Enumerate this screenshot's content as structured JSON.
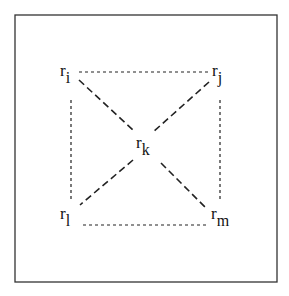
{
  "diagram": {
    "nodes": [
      {
        "id": "i",
        "base": "r",
        "sub": "i",
        "x": 54,
        "y": 62
      },
      {
        "id": "j",
        "base": "r",
        "sub": "j",
        "x": 208,
        "y": 62
      },
      {
        "id": "k",
        "base": "r",
        "sub": "k",
        "x": 136,
        "y": 136
      },
      {
        "id": "l",
        "base": "r",
        "sub": "l",
        "x": 57,
        "y": 206
      },
      {
        "id": "m",
        "base": "r",
        "sub": "m",
        "x": 208,
        "y": 206
      }
    ],
    "edges": [
      {
        "from": "i",
        "to": "j",
        "style": "short-dash"
      },
      {
        "from": "l",
        "to": "m",
        "style": "short-dash"
      },
      {
        "from": "i",
        "to": "l",
        "style": "short-dash"
      },
      {
        "from": "j",
        "to": "m",
        "style": "short-dash"
      },
      {
        "from": "i",
        "to": "m",
        "style": "long-dash",
        "via": "k"
      },
      {
        "from": "j",
        "to": "l",
        "style": "long-dash",
        "via": "k"
      }
    ],
    "colors": {
      "line": "#222222",
      "border": "#333333",
      "background": "#ffffff"
    }
  }
}
